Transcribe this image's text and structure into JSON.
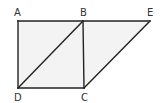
{
  "diagram": {
    "type": "geometry-figure",
    "points": [
      {
        "id": "A",
        "label": "A",
        "x": 18,
        "y": 21,
        "label_x": 16,
        "label_y": 16
      },
      {
        "id": "B",
        "label": "B",
        "x": 83,
        "y": 21,
        "label_x": 80,
        "label_y": 16
      },
      {
        "id": "E",
        "label": "E",
        "x": 150,
        "y": 21,
        "label_x": 147,
        "label_y": 16
      },
      {
        "id": "D",
        "label": "D",
        "x": 18,
        "y": 88,
        "label_x": 14,
        "label_y": 101
      },
      {
        "id": "C",
        "label": "C",
        "x": 84,
        "y": 88,
        "label_x": 81,
        "label_y": 101
      }
    ],
    "segments": [
      {
        "from": "A",
        "to": "B"
      },
      {
        "from": "B",
        "to": "E"
      },
      {
        "from": "A",
        "to": "D"
      },
      {
        "from": "D",
        "to": "C"
      },
      {
        "from": "B",
        "to": "C"
      },
      {
        "from": "D",
        "to": "B"
      },
      {
        "from": "C",
        "to": "E"
      }
    ],
    "colors": {
      "stroke": "#222222",
      "fill": "#f3f3f3",
      "label": "#333333",
      "background": "#ffffff"
    }
  }
}
